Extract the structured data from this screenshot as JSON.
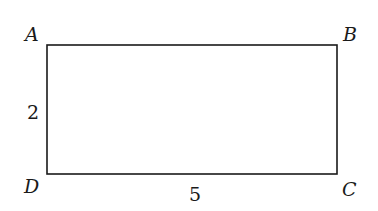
{
  "figure": {
    "shape": "rectangle",
    "vertices": {
      "top_left": "A",
      "top_right": "B",
      "bottom_right": "C",
      "bottom_left": "D"
    },
    "dimensions": {
      "left_side_label": "2",
      "bottom_side_label": "5"
    },
    "stroke_color": "#1a1a1a",
    "background_color": "#ffffff"
  }
}
